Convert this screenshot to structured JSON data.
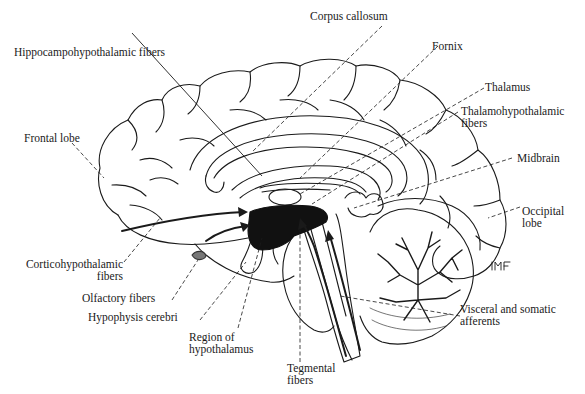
{
  "figure": {
    "colors": {
      "ink": "#1a1a1a",
      "background": "#ffffff"
    }
  },
  "labels": {
    "corpus_callosum": "Corpus callosum",
    "hippocampohypothalamic": "Hippocampohypothalamic fibers",
    "fornix": "Fornix",
    "thalamus": "Thalamus",
    "thalamohypothalamic_1": "Thalamohypothalamic",
    "thalamohypothalamic_2": "fibers",
    "frontal_lobe": "Frontal lobe",
    "midbrain": "Midbrain",
    "occipital_1": "Occipital",
    "occipital_2": "lobe",
    "corticohypothalamic_1": "Corticohypothalamic",
    "corticohypothalamic_2": "fibers",
    "olfactory": "Olfactory fibers",
    "hypophysis": "Hypophysis cerebri",
    "region_1": "Region of",
    "region_2": "hypothalamus",
    "visceral_1": "Visceral and somatic",
    "visceral_2": "afferents",
    "tegmental_1": "Tegmental",
    "tegmental_2": "fibers",
    "signature": "mf"
  }
}
